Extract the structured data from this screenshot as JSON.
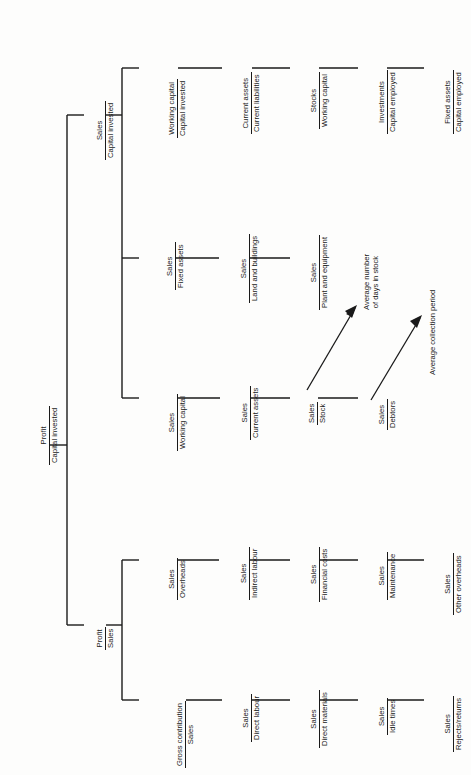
{
  "diagram": {
    "orientation": "rotated-90",
    "ink_color": "#1a1a1a",
    "background_color": "#fdfdfc",
    "root": {
      "numerator": "Profit",
      "denominator": "Capital invested"
    },
    "level2": [
      {
        "numerator": "Sales",
        "denominator": "Capital invested"
      },
      {
        "numerator": "Profit",
        "denominator": "Sales"
      }
    ],
    "capital_branches": [
      {
        "numerator": "Working capital",
        "denominator": "Capital invested"
      },
      {
        "numerator": "Sales",
        "denominator": "Fixed assets"
      },
      {
        "numerator": "Sales",
        "denominator": "Working capital"
      }
    ],
    "working_capital_chain": [
      {
        "numerator": "Current assets",
        "denominator": "Current liabilities"
      },
      {
        "numerator": "Stocks",
        "denominator": "Working capital"
      },
      {
        "numerator": "Investments",
        "denominator": "Capital employed"
      },
      {
        "numerator": "Fixed assets",
        "denominator": "Capital employed"
      }
    ],
    "fixed_assets_chain": [
      {
        "numerator": "Sales",
        "denominator": "Land and buildings"
      },
      {
        "numerator": "Sales",
        "denominator": "Plant and equipment"
      }
    ],
    "sales_working_capital_chain": [
      {
        "numerator": "Sales",
        "denominator": "Current assets"
      },
      {
        "numerator": "Sales",
        "denominator": "Stock"
      },
      {
        "numerator": "Sales",
        "denominator": "Debtors"
      }
    ],
    "profit_sales_branches": [
      {
        "numerator": "Sales",
        "denominator": "Overheads"
      },
      {
        "numerator": "Gross contribution",
        "denominator": "Sales"
      }
    ],
    "overheads_chain": [
      {
        "numerator": "Sales",
        "denominator": "Indirect labour"
      },
      {
        "numerator": "Sales",
        "denominator": "Financial costs"
      },
      {
        "numerator": "Sales",
        "denominator": "Maintenance"
      },
      {
        "numerator": "Sales",
        "denominator": "Other overheads"
      }
    ],
    "contribution_chain": [
      {
        "numerator": "Sales",
        "denominator": "Direct labour"
      },
      {
        "numerator": "Sales",
        "denominator": "Direct materials"
      },
      {
        "numerator": "Sales",
        "denominator": "Idle times"
      },
      {
        "numerator": "Sales",
        "denominator": "Rejects/returns"
      }
    ],
    "annotations": [
      {
        "line1": "Average number",
        "line2": "of days in stock",
        "source": "Sales / Stock"
      },
      {
        "line1": "Average collection period",
        "line2": "",
        "source": "Sales / Debtors"
      }
    ]
  }
}
